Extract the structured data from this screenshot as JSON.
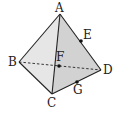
{
  "figure": {
    "type": "tetrahedron",
    "colors": {
      "edge": "#222222",
      "face_left": "#e6e6e6",
      "face_right": "#d2d2d2",
      "point": "#111111"
    },
    "vertices": {
      "A": {
        "label": "A",
        "x": 60,
        "y": 14
      },
      "B": {
        "label": "B",
        "x": 19,
        "y": 62
      },
      "C": {
        "label": "C",
        "x": 52,
        "y": 94
      },
      "D": {
        "label": "D",
        "x": 101,
        "y": 70
      }
    },
    "points": {
      "E": {
        "label": "E",
        "x": 81,
        "y": 41,
        "on_edge": "AD"
      },
      "F": {
        "label": "F",
        "x": 59,
        "y": 66,
        "on_edge": "BD"
      },
      "G": {
        "label": "G",
        "x": 77,
        "y": 82,
        "on_edge": "CD"
      }
    },
    "edges_solid": [
      "AB",
      "AC",
      "AD",
      "BC",
      "CD"
    ],
    "edges_hidden": [
      "BD"
    ]
  }
}
